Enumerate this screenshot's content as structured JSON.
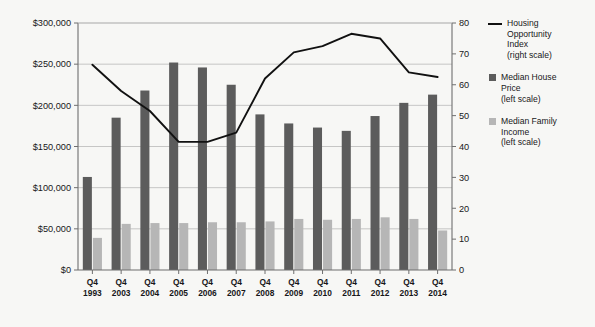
{
  "chart_data": {
    "type": "bar",
    "title": "",
    "subtitle": "",
    "xlabel": "",
    "ylabel": "",
    "categories": [
      "Q4\n1993",
      "Q4\n2003",
      "Q4\n2004",
      "Q4\n2005",
      "Q4\n2006",
      "Q4\n2007",
      "Q4\n2008",
      "Q4\n2009",
      "Q4\n2010",
      "Q4\n2011",
      "Q4\n2012",
      "Q4\n2013",
      "Q4\n2014"
    ],
    "categories_flat": [
      "Q4 1993",
      "Q4 2003",
      "Q4 2004",
      "Q4 2005",
      "Q4 2006",
      "Q4 2007",
      "Q4 2008",
      "Q4 2009",
      "Q4 2010",
      "Q4 2011",
      "Q4 2012",
      "Q4 2013",
      "Q4 2014"
    ],
    "series": [
      {
        "name": "Median House Price",
        "scale": "left",
        "type": "bar",
        "color": "#5c5c5c",
        "values": [
          113000,
          185000,
          218000,
          252000,
          246000,
          225000,
          189000,
          178000,
          173000,
          169000,
          187000,
          203000,
          213000
        ]
      },
      {
        "name": "Median Family Income",
        "scale": "left",
        "type": "bar",
        "color": "#b6b6b6",
        "values": [
          39000,
          56000,
          57000,
          57000,
          58000,
          58000,
          59000,
          62000,
          61000,
          62000,
          64000,
          62000,
          48000
        ]
      },
      {
        "name": "Housing Opportunity Index",
        "scale": "right",
        "type": "line",
        "color": "#111111",
        "values": [
          66.5,
          58.0,
          51.5,
          41.5,
          41.5,
          44.5,
          62.0,
          70.5,
          72.5,
          76.5,
          75.0,
          64.0,
          62.5
        ]
      }
    ],
    "left_axis": {
      "min": 0,
      "max": 300000,
      "step": 50000,
      "ticks": [
        "$0",
        "$50,000",
        "$100,000",
        "$150,000",
        "$200,000",
        "$250,000",
        "$300,000"
      ],
      "tick_values": [
        0,
        50000,
        100000,
        150000,
        200000,
        250000,
        300000
      ]
    },
    "right_axis": {
      "min": 0,
      "max": 80,
      "step": 10,
      "ticks": [
        "0",
        "10",
        "20",
        "30",
        "40",
        "50",
        "60",
        "70",
        "80"
      ],
      "tick_values": [
        0,
        10,
        20,
        30,
        40,
        50,
        60,
        70,
        80
      ]
    },
    "grid": true,
    "legend_position": "right"
  },
  "legend": {
    "entries": [
      {
        "label": "Housing\nOpportunity\nIndex\n(right scale)",
        "marker": "line",
        "color": "#111111"
      },
      {
        "label": "Median House\nPrice\n(left scale)",
        "marker": "square",
        "color": "#5c5c5c"
      },
      {
        "label": "Median Family\nIncome\n(left scale)",
        "marker": "square",
        "color": "#b6b6b6"
      }
    ]
  }
}
